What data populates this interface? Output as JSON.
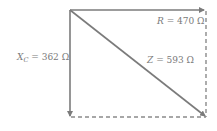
{
  "diagram": {
    "labels": {
      "r": {
        "symbol": "R",
        "eq": " = 470 Ω"
      },
      "xc": {
        "symbol": "X",
        "sub": "C",
        "eq": " = 362 Ω"
      },
      "z": {
        "symbol": "Z",
        "eq": " = 593 Ω"
      }
    },
    "colors": {
      "line": "#7b7b7b",
      "dashed": "#8a8a8a",
      "text": "#7a7a7a"
    }
  }
}
